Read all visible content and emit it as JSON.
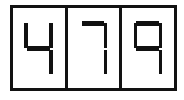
{
  "display": {
    "kind": "seven-segment-display",
    "reading": "479",
    "digit_count": 3,
    "colors": {
      "segment_on": "#111111",
      "frame": "#121212",
      "background": "#ffffff"
    },
    "digits": [
      {
        "value": "4",
        "label": "digit-1",
        "segments": {
          "a": false,
          "b": true,
          "c": true,
          "d": false,
          "e": false,
          "f": true,
          "g": true
        }
      },
      {
        "value": "7",
        "label": "digit-2",
        "segments": {
          "a": true,
          "b": true,
          "c": true,
          "d": false,
          "e": false,
          "f": false,
          "g": false
        }
      },
      {
        "value": "9",
        "label": "digit-3",
        "segments": {
          "a": true,
          "b": true,
          "c": true,
          "d": false,
          "e": false,
          "f": true,
          "g": true
        }
      }
    ]
  }
}
